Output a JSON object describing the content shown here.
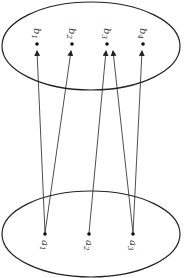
{
  "diagram": {
    "type": "mapping",
    "sets": [
      {
        "name": "codomain",
        "position": "top",
        "elements": [
          "b1",
          "b2",
          "b3",
          "b4"
        ]
      },
      {
        "name": "domain",
        "position": "bottom",
        "elements": [
          "a1",
          "a2",
          "a3"
        ]
      }
    ],
    "labels": {
      "b1": {
        "base": "b",
        "sub": "1"
      },
      "b2": {
        "base": "b",
        "sub": "2"
      },
      "b3": {
        "base": "b",
        "sub": "3"
      },
      "b4": {
        "base": "b",
        "sub": "4"
      },
      "a1": {
        "base": "a",
        "sub": "1"
      },
      "a2": {
        "base": "a",
        "sub": "2"
      },
      "a3": {
        "base": "a",
        "sub": "3"
      }
    },
    "arrows": [
      {
        "from": "a1",
        "to": "b1"
      },
      {
        "from": "a1",
        "to": "b2"
      },
      {
        "from": "a2",
        "to": "b3"
      },
      {
        "from": "a3",
        "to": "b3"
      },
      {
        "from": "a3",
        "to": "b4"
      }
    ],
    "colors": {
      "stroke": "#222222",
      "background": "#ffffff"
    }
  }
}
